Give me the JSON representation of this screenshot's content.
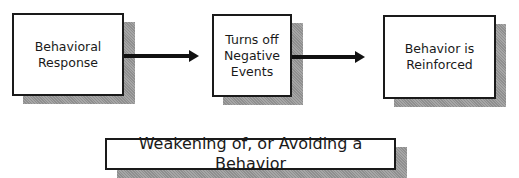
{
  "diagram": {
    "type": "flowchart",
    "nodes": [
      {
        "id": "behavioral-response",
        "label": "Behavioral\nResponse"
      },
      {
        "id": "turns-off-negative-events",
        "label": "Turns off\nNegative\nEvents"
      },
      {
        "id": "behavior-reinforced",
        "label": "Behavior is\nReinforced"
      }
    ],
    "edges": [
      {
        "from": "behavioral-response",
        "to": "turns-off-negative-events"
      },
      {
        "from": "turns-off-negative-events",
        "to": "behavior-reinforced"
      }
    ],
    "caption": "Weakening of, or Avoiding a Behavior"
  },
  "colors": {
    "border": "#1a1a1a",
    "shadow": "#9a9a9a",
    "background": "#ffffff"
  }
}
